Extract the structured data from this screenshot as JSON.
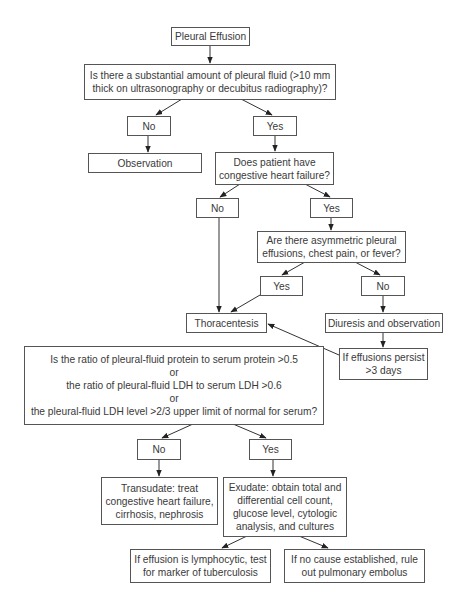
{
  "flowchart": {
    "start": {
      "lines": [
        "Pleural Effusion"
      ]
    },
    "q_fluid": {
      "lines": [
        "Is there a substantial amount of pleural fluid (>10 mm",
        "thick on ultrasonography or decubitus radiography)?"
      ]
    },
    "q_fluid_no": {
      "lines": [
        "No"
      ]
    },
    "q_fluid_yes": {
      "lines": [
        "Yes"
      ]
    },
    "observation": {
      "lines": [
        "Observation"
      ]
    },
    "q_chf": {
      "lines": [
        "Does patient have",
        "congestive heart failure?"
      ]
    },
    "q_chf_no": {
      "lines": [
        "No"
      ]
    },
    "q_chf_yes": {
      "lines": [
        "Yes"
      ]
    },
    "q_asym": {
      "lines": [
        "Are there asymmetric pleural",
        "effusions, chest pain, or fever?"
      ]
    },
    "q_asym_yes": {
      "lines": [
        "Yes"
      ]
    },
    "q_asym_no": {
      "lines": [
        "No"
      ]
    },
    "thoracentesis": {
      "lines": [
        "Thoracentesis"
      ]
    },
    "diuresis": {
      "lines": [
        "Diuresis and observation"
      ]
    },
    "persist": {
      "lines": [
        "If effusions persist",
        ">3 days"
      ]
    },
    "q_criteria": {
      "lines": [
        "Is the ratio of pleural-fluid protein to serum protein >0.5",
        "or",
        "the ratio of pleural-fluid LDH to serum LDH >0.6",
        "or",
        "the pleural-fluid LDH level >2/3 upper limit of normal for serum?"
      ]
    },
    "q_criteria_no": {
      "lines": [
        "No"
      ]
    },
    "q_criteria_yes": {
      "lines": [
        "Yes"
      ]
    },
    "transudate": {
      "lines": [
        "Transudate: treat",
        "congestive heart failure,",
        "cirrhosis, nephrosis"
      ]
    },
    "exudate": {
      "lines": [
        "Exudate: obtain total and",
        "differential cell count,",
        "glucose level, cytologic",
        "analysis, and cultures"
      ]
    },
    "lymphocytic": {
      "lines": [
        "If effusion is lymphocytic, test",
        "for marker of tuberculosis"
      ]
    },
    "embolus": {
      "lines": [
        "If no cause established, rule",
        "out pulmonary embolus"
      ]
    }
  },
  "colors": {
    "border": "#555555",
    "text": "#3a3a3a",
    "arrow": "#333333",
    "background": "#ffffff"
  }
}
